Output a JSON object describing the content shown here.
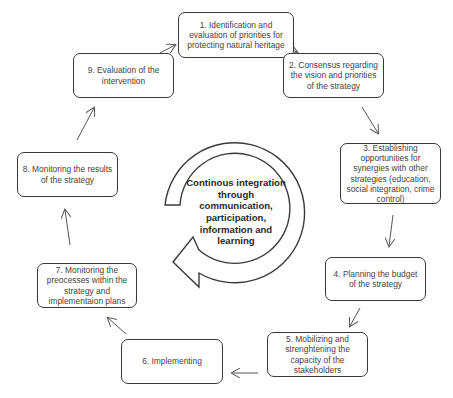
{
  "diagram": {
    "type": "cycle",
    "center": {
      "label": "Continous integration through communication, participation, information and learning"
    },
    "steps": [
      {
        "id": 1,
        "label": "1. Identification and evaluation of priorities for protecting natural heritage"
      },
      {
        "id": 2,
        "label": "2. Consensus regarding the vision and priorities of the strategy"
      },
      {
        "id": 3,
        "label": "3. Establishing opportunities for synergies with other strategies (education, social integration, crime control)"
      },
      {
        "id": 4,
        "label": "4. Planning the budget of the strategy"
      },
      {
        "id": 5,
        "label": "5. Mobilizing and strenghtening the capacity of the stakeholders"
      },
      {
        "id": 6,
        "label": "6. Implementing"
      },
      {
        "id": 7,
        "label": "7. Monitoring the preocesses within the strategy and implementaion plans"
      },
      {
        "id": 8,
        "label": "8. Monitoring the results of the strategy"
      },
      {
        "id": 9,
        "label": "9. Evaluation of the intervention"
      }
    ],
    "edges": [
      {
        "from": 1,
        "to": 2
      },
      {
        "from": 2,
        "to": 3
      },
      {
        "from": 3,
        "to": 4
      },
      {
        "from": 4,
        "to": 5
      },
      {
        "from": 5,
        "to": 6
      },
      {
        "from": 6,
        "to": 7
      },
      {
        "from": 7,
        "to": 8
      },
      {
        "from": 8,
        "to": 9
      },
      {
        "from": 9,
        "to": 1
      }
    ],
    "colors": {
      "stroke": "#3a3a3a",
      "text": "#444444",
      "background": "#ffffff"
    }
  }
}
